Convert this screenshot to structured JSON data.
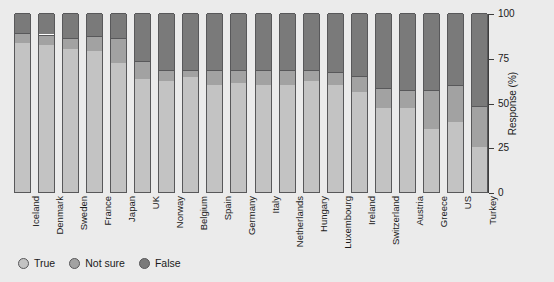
{
  "chart_data": {
    "type": "bar",
    "stacked": true,
    "title": "",
    "xlabel": "",
    "ylabel": "Response (%)",
    "ylim": [
      0,
      100
    ],
    "yticks": [
      0,
      25,
      50,
      75,
      100
    ],
    "ytick_labels": [
      "0",
      "25",
      "50",
      "75",
      "100"
    ],
    "grid": false,
    "legend_position": "bottom-left",
    "categories": [
      "Iceland",
      "Denmark",
      "Sweden",
      "France",
      "Japan",
      "UK",
      "Norway",
      "Belgium",
      "Spain",
      "Germany",
      "Italy",
      "Netherlands",
      "Hungary",
      "Luxembourg",
      "Ireland",
      "Switzerland",
      "Austria",
      "Greece",
      "US",
      "Turkey"
    ],
    "series": [
      {
        "name": "True",
        "color": "#c3c3c3",
        "values": [
          83,
          82,
          80,
          79,
          72,
          63,
          62,
          64,
          60,
          61,
          60,
          60,
          62,
          60,
          56,
          47,
          47,
          35,
          39,
          25
        ]
      },
      {
        "name": "Not sure",
        "color": "#a2a2a2",
        "values": [
          6,
          6,
          6,
          8,
          14,
          10,
          6,
          4,
          8,
          7,
          8,
          8,
          6,
          7,
          9,
          11,
          10,
          22,
          21,
          23
        ]
      },
      {
        "name": "False",
        "color": "#7a7a7a",
        "values": [
          11,
          12,
          14,
          13,
          14,
          27,
          32,
          32,
          32,
          32,
          32,
          32,
          32,
          33,
          35,
          42,
          43,
          43,
          40,
          52
        ]
      }
    ]
  },
  "legend": {
    "items": [
      {
        "label": "True",
        "color": "#c3c3c3"
      },
      {
        "label": "Not sure",
        "color": "#a2a2a2"
      },
      {
        "label": "False",
        "color": "#7a7a7a"
      }
    ]
  },
  "axis": {
    "y_title": "Response (%)"
  }
}
